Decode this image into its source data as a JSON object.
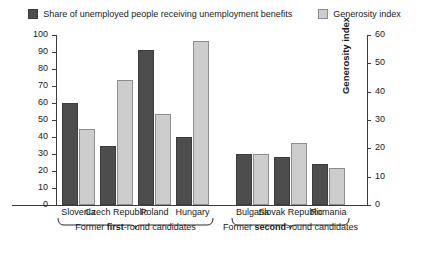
{
  "legend": {
    "entries": [
      {
        "label": "Share of unemployed people receiving unemployment benefits",
        "icon": "square-filled-dark",
        "color": "#4d4d4d"
      },
      {
        "label": "Generosity index",
        "icon": "square-outline-light",
        "color": "#cdcdcd"
      }
    ]
  },
  "chart_data": {
    "type": "bar",
    "title": "",
    "categories": [
      "Slovenia",
      "Czech Republic",
      "Poland",
      "Hungary",
      "Bulgaria",
      "Slovak Republic",
      "Romania"
    ],
    "series": [
      {
        "name": "Share of unemployed people receiving unemployment benefits",
        "axis": "left",
        "color": "#4d4d4d",
        "values": [
          60,
          35,
          91,
          40,
          30,
          28,
          24
        ]
      },
      {
        "name": "Generosity index",
        "axis": "right",
        "color": "#cdcdcd",
        "values": [
          27,
          44,
          32,
          58,
          18,
          22,
          13
        ]
      }
    ],
    "left_axis": {
      "label": "Share of unemployed people receiving unemployment benefits (%)",
      "min": 0,
      "max": 100,
      "step": 10,
      "ticks": [
        "0",
        "10",
        "20",
        "30",
        "40",
        "50",
        "60",
        "70",
        "80",
        "90",
        "100"
      ]
    },
    "right_axis": {
      "label": "Generosity index",
      "min": 0,
      "max": 60,
      "step": 10,
      "ticks": [
        "0",
        "10",
        "20",
        "30",
        "40",
        "50",
        "60"
      ]
    },
    "grid": false,
    "legend_position": "top",
    "groups": [
      {
        "label_prefix": "Former ",
        "label_bold": "first",
        "label_suffix": "-round candidates",
        "categories": [
          "Slovenia",
          "Czech Republic",
          "Poland",
          "Hungary"
        ]
      },
      {
        "label_prefix": "Former ",
        "label_bold": "second",
        "label_suffix": "-round candidates",
        "categories": [
          "Bulgaria",
          "Slovak Republic",
          "Romania"
        ]
      }
    ]
  }
}
